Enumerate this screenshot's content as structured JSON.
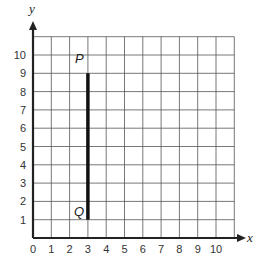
{
  "chart_data": {
    "type": "line",
    "title": "",
    "xlabel": "x",
    "ylabel": "y",
    "xlim": [
      0,
      11
    ],
    "ylim": [
      0,
      11
    ],
    "grid": true,
    "x_ticks": [
      "0",
      "1",
      "2",
      "3",
      "4",
      "5",
      "6",
      "7",
      "8",
      "9",
      "10"
    ],
    "y_ticks": [
      "1",
      "2",
      "3",
      "4",
      "5",
      "6",
      "7",
      "8",
      "9",
      "10"
    ],
    "series": [
      {
        "name": "segment PQ",
        "points": [
          {
            "label": "P",
            "x": 3,
            "y": 9
          },
          {
            "label": "Q",
            "x": 3,
            "y": 1
          }
        ]
      }
    ]
  },
  "colors": {
    "grid": "#555555",
    "axis": "#222222",
    "segment": "#111111"
  },
  "labels": {
    "x_axis": "x",
    "y_axis": "y",
    "point_p": "P",
    "point_q": "Q"
  }
}
